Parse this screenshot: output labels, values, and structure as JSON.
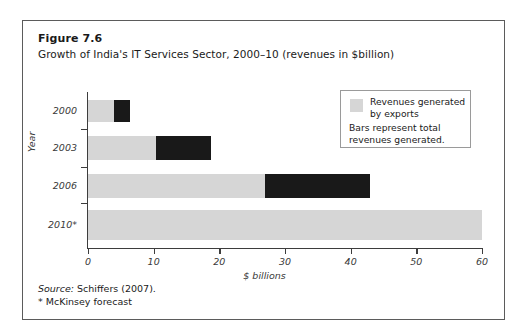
{
  "figure": {
    "label": "Figure 7.6",
    "title": "Growth of India's IT Services Sector, 2000–10 (revenues in $billion)",
    "source_prefix": "Source:",
    "source_text": "Schiffers (2007).",
    "forecast_note": "* McKinsey forecast"
  },
  "legend": {
    "swatch_label": "Revenues generated by exports",
    "note": "Bars represent total revenues generated."
  },
  "colors": {
    "exports": "#d6d6d6",
    "domestic": "#191919",
    "frame": "#5b5b5b",
    "axis": "#3d3d3d",
    "legend_border": "#9a9a9a"
  },
  "chart_data": {
    "type": "bar",
    "orientation": "horizontal",
    "stacked": true,
    "title": "Growth of India's IT Services Sector, 2000–10 (revenues in $billion)",
    "xlabel": "$ billions",
    "ylabel": "Year",
    "xlim": [
      0,
      60
    ],
    "xticks": [
      0,
      10,
      20,
      30,
      40,
      50,
      60
    ],
    "grid": false,
    "legend_position": "top-right",
    "categories": [
      "2000",
      "2003",
      "2006",
      "2010*"
    ],
    "series": [
      {
        "name": "Revenues generated by exports",
        "color": "#d6d6d6",
        "values": [
          4.0,
          10.3,
          27.0,
          60.0
        ]
      },
      {
        "name": "Other revenues (remainder of total)",
        "color": "#191919",
        "values": [
          2.4,
          8.5,
          16.0,
          0.0
        ]
      }
    ],
    "totals": [
      6.4,
      18.8,
      43.0,
      60.0
    ],
    "annotations": [
      "* McKinsey forecast"
    ]
  }
}
